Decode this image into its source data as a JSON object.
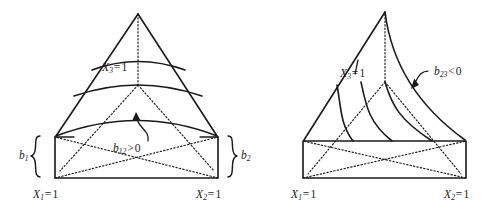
{
  "figure": {
    "title": "",
    "background_color": "#ffffff",
    "line_color": "#1a1a1a",
    "panels": [
      {
        "id": "left-panel",
        "name": "positive-interaction-surface",
        "apex": {
          "x": 138,
          "y": 14
        },
        "base_rect": {
          "left": 55,
          "right": 218,
          "top": 137,
          "bottom": 178
        },
        "labels": {
          "ridge": {
            "var": "X",
            "sub": "3",
            "op": "=",
            "value": "1",
            "text": "X3 = 1"
          },
          "base_left": {
            "var": "X",
            "sub": "1",
            "op": "=",
            "value": "1",
            "text": "X1 = 1"
          },
          "base_right": {
            "var": "X",
            "sub": "2",
            "op": "=",
            "value": "1",
            "text": "X2 = 1"
          },
          "annotation": {
            "var": "b",
            "sub": "12",
            "op": ">",
            "value": "0",
            "text": "b12 > 0"
          },
          "brace_left": {
            "var": "b",
            "sub": "1",
            "text": "b1"
          },
          "brace_right": {
            "var": "b",
            "sub": "2",
            "text": "b2"
          }
        }
      },
      {
        "id": "right-panel",
        "name": "negative-interaction-surface",
        "apex": {
          "x": 385,
          "y": 12
        },
        "base_rect": {
          "left": 303,
          "right": 466,
          "top": 141,
          "bottom": 178
        },
        "labels": {
          "ridge": {
            "var": "X",
            "sub": "3",
            "op": "=",
            "value": "1",
            "text": "X3 = 1"
          },
          "base_left": {
            "var": "X",
            "sub": "1",
            "op": "=",
            "value": "1",
            "text": "X1 = 1"
          },
          "base_right": {
            "var": "X",
            "sub": "2",
            "op": "=",
            "value": "1",
            "text": "X2 = 1"
          },
          "annotation": {
            "var": "b",
            "sub": "23",
            "op": "<",
            "value": "0",
            "text": "b23 < 0"
          }
        }
      }
    ]
  }
}
